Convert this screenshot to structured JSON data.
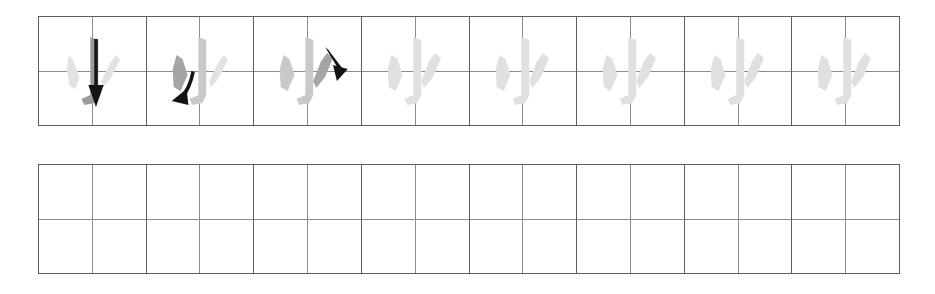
{
  "worksheet": {
    "character": "小",
    "stroke_count": 3,
    "colors": {
      "grid_border": "#5d5d5d",
      "grid_guide": "#8c8c8c",
      "stroke_active": "#8f8f8f",
      "stroke_faded": "#d8d8d8",
      "stroke_ghost": "#e6e6e6",
      "arrow": "#141414",
      "page_background": "#ffffff"
    },
    "rows": [
      {
        "name": "stroke-order-demo-row",
        "cell_count": 8,
        "cells": [
          {
            "index": 1,
            "type": "stroke-demo",
            "strokes_drawn": 1,
            "active_stroke": "vertical-hook",
            "arrow_direction": "down",
            "character": "小"
          },
          {
            "index": 2,
            "type": "stroke-demo",
            "strokes_drawn": 2,
            "active_stroke": "left-dot",
            "arrow_direction": "down-left",
            "character": "小"
          },
          {
            "index": 3,
            "type": "stroke-demo",
            "strokes_drawn": 3,
            "active_stroke": "right-dot",
            "arrow_direction": "down-right",
            "character": "小"
          },
          {
            "index": 4,
            "type": "trace-ghost",
            "strokes_drawn": 3,
            "active_stroke": "",
            "arrow_direction": "",
            "character": "小"
          },
          {
            "index": 5,
            "type": "trace-ghost",
            "strokes_drawn": 3,
            "active_stroke": "",
            "arrow_direction": "",
            "character": "小"
          },
          {
            "index": 6,
            "type": "trace-ghost",
            "strokes_drawn": 3,
            "active_stroke": "",
            "arrow_direction": "",
            "character": "小"
          },
          {
            "index": 7,
            "type": "trace-ghost",
            "strokes_drawn": 3,
            "active_stroke": "",
            "arrow_direction": "",
            "character": "小"
          },
          {
            "index": 8,
            "type": "trace-ghost",
            "strokes_drawn": 3,
            "active_stroke": "",
            "arrow_direction": "",
            "character": "小"
          }
        ]
      },
      {
        "name": "blank-practice-row",
        "cell_count": 8,
        "cells": [
          {
            "index": 1,
            "type": "blank",
            "character": ""
          },
          {
            "index": 2,
            "type": "blank",
            "character": ""
          },
          {
            "index": 3,
            "type": "blank",
            "character": ""
          },
          {
            "index": 4,
            "type": "blank",
            "character": ""
          },
          {
            "index": 5,
            "type": "blank",
            "character": ""
          },
          {
            "index": 6,
            "type": "blank",
            "character": ""
          },
          {
            "index": 7,
            "type": "blank",
            "character": ""
          },
          {
            "index": 8,
            "type": "blank",
            "character": ""
          }
        ]
      }
    ]
  }
}
